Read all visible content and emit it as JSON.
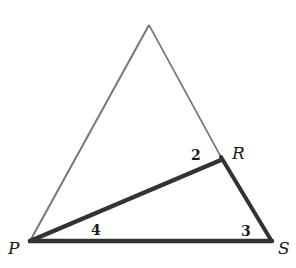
{
  "diagram": {
    "type": "geometry-triangle",
    "vertices": {
      "P": {
        "label": "P",
        "x": 30,
        "y": 241
      },
      "S": {
        "label": "S",
        "x": 272,
        "y": 241
      },
      "R": {
        "label": "R",
        "x": 221,
        "y": 157
      },
      "apex": {
        "label": "",
        "x": 149,
        "y": 25
      }
    },
    "angle_labels": [
      {
        "label": "2",
        "at": "R"
      },
      {
        "label": "4",
        "at": "P"
      },
      {
        "label": "3",
        "at": "S"
      }
    ],
    "highlighted_triangle": "PRS",
    "colors": {
      "thin_line": "#777777",
      "thick_line": "#333333",
      "text": "#1a1a1a"
    }
  }
}
